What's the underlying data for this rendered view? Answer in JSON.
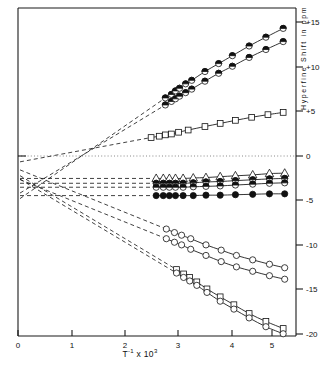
{
  "chart_data": {
    "type": "line",
    "title": "",
    "subtitle": "",
    "xlabel": "T⁻¹ x 10³",
    "ylabel": "Hyperfine  Shift  in  ppm",
    "xlabel_base": "T",
    "xlabel_sup": "-1",
    "xlabel_mid": "x 10",
    "xlabel_sup2": "3",
    "xlim": [
      0,
      5.7
    ],
    "ylim": [
      -21.5,
      16.5
    ],
    "xticks": [
      0,
      1,
      2,
      3,
      4,
      5
    ],
    "xticklabels": [
      "0",
      "1",
      "2",
      "3",
      "4",
      "5"
    ],
    "yticks": [
      15,
      10,
      5,
      0,
      -5,
      -10,
      -15,
      -20
    ],
    "yticklabels": [
      "+15",
      "+10",
      "+5",
      "0",
      "-5",
      "-10",
      "-15",
      "-20"
    ],
    "grid": false,
    "legend": "none",
    "zero_line": true,
    "axis_position": "y-axis ticks on right side, x-axis on bottom",
    "series": [
      {
        "name": "upper-series-1",
        "marker": "half-filled-circle",
        "extrapolated": true,
        "x": [
          2.9,
          3.02,
          3.1,
          3.18,
          3.3,
          3.42,
          3.68,
          3.95,
          4.22,
          4.55,
          4.88,
          5.22
        ],
        "y": [
          6.6,
          7.0,
          7.4,
          7.7,
          8.2,
          8.6,
          9.6,
          10.5,
          11.4,
          12.5,
          13.5,
          14.5
        ]
      },
      {
        "name": "upper-series-2",
        "marker": "half-filled-circle",
        "extrapolated": true,
        "x": [
          2.9,
          3.02,
          3.1,
          3.18,
          3.3,
          3.42,
          3.68,
          3.95,
          4.22,
          4.55,
          4.88,
          5.22
        ],
        "y": [
          5.8,
          6.2,
          6.5,
          6.8,
          7.2,
          7.6,
          8.5,
          9.4,
          10.2,
          11.2,
          12.1,
          13.0
        ]
      },
      {
        "name": "square-series-positive",
        "marker": "open-square",
        "extrapolated": true,
        "x": [
          2.62,
          2.78,
          2.9,
          3.02,
          3.16,
          3.35,
          3.68,
          3.98,
          4.28,
          4.6,
          4.92,
          5.22
        ],
        "y": [
          2.1,
          2.25,
          2.4,
          2.5,
          2.7,
          2.95,
          3.35,
          3.7,
          4.05,
          4.4,
          4.7,
          4.95
        ]
      },
      {
        "name": "cluster-series-triangle",
        "marker": "open-triangle",
        "extrapolated": true,
        "x": [
          2.72,
          2.86,
          2.98,
          3.1,
          3.25,
          3.45,
          3.7,
          3.98,
          4.28,
          4.62,
          4.95,
          5.25
        ],
        "y": [
          -2.55,
          -2.55,
          -2.55,
          -2.55,
          -2.55,
          -2.5,
          -2.45,
          -2.35,
          -2.25,
          -2.15,
          -2.0,
          -1.95
        ]
      },
      {
        "name": "cluster-series-half-a",
        "marker": "half-filled-circle",
        "extrapolated": true,
        "x": [
          2.72,
          2.86,
          2.98,
          3.1,
          3.25,
          3.45,
          3.7,
          3.98,
          4.28,
          4.62,
          4.95,
          5.25
        ],
        "y": [
          -3.1,
          -3.1,
          -3.1,
          -3.1,
          -3.1,
          -3.05,
          -2.95,
          -2.9,
          -2.8,
          -2.7,
          -2.6,
          -2.55
        ]
      },
      {
        "name": "cluster-series-half-b",
        "marker": "half-filled-circle",
        "extrapolated": true,
        "x": [
          2.72,
          2.86,
          2.98,
          3.1,
          3.25,
          3.45,
          3.7,
          3.98,
          4.28,
          4.62,
          4.95,
          5.25
        ],
        "y": [
          -3.55,
          -3.55,
          -3.55,
          -3.55,
          -3.55,
          -3.5,
          -3.45,
          -3.4,
          -3.3,
          -3.2,
          -3.1,
          -3.05
        ]
      },
      {
        "name": "cluster-series-filled",
        "marker": "filled-circle",
        "extrapolated": true,
        "x": [
          2.72,
          2.86,
          2.98,
          3.1,
          3.25,
          3.45,
          3.7,
          3.98,
          4.28,
          4.62,
          4.95,
          5.25
        ],
        "y": [
          -4.5,
          -4.5,
          -4.5,
          -4.5,
          -4.5,
          -4.5,
          -4.45,
          -4.45,
          -4.4,
          -4.35,
          -4.3,
          -4.3
        ]
      },
      {
        "name": "lower-circle-series-1",
        "marker": "open-circle",
        "extrapolated": true,
        "x": [
          2.92,
          3.08,
          3.22,
          3.4,
          3.7,
          4.0,
          4.3,
          4.62,
          4.95,
          5.25
        ],
        "y": [
          -8.3,
          -8.7,
          -9.0,
          -9.4,
          -10.1,
          -10.7,
          -11.3,
          -11.8,
          -12.3,
          -12.7
        ]
      },
      {
        "name": "lower-circle-series-2",
        "marker": "open-circle",
        "extrapolated": true,
        "x": [
          2.92,
          3.08,
          3.22,
          3.4,
          3.7,
          4.0,
          4.3,
          4.62,
          4.95,
          5.25
        ],
        "y": [
          -9.4,
          -9.8,
          -10.1,
          -10.6,
          -11.3,
          -12.0,
          -12.6,
          -13.1,
          -13.6,
          -14.0
        ]
      },
      {
        "name": "lower-square-series",
        "marker": "open-square",
        "extrapolated": true,
        "x": [
          3.12,
          3.26,
          3.38,
          3.52,
          3.72,
          3.98,
          4.25,
          4.55,
          4.88,
          5.22
        ],
        "y": [
          -12.9,
          -13.4,
          -13.8,
          -14.3,
          -15.1,
          -16.0,
          -16.9,
          -17.9,
          -18.8,
          -19.6
        ]
      },
      {
        "name": "lower-bottom-series",
        "marker": "open-circle",
        "extrapolated": true,
        "x": [
          3.12,
          3.26,
          3.38,
          3.52,
          3.72,
          3.98,
          4.25,
          4.55,
          4.88,
          5.22
        ],
        "y": [
          -13.3,
          -13.8,
          -14.2,
          -14.7,
          -15.5,
          -16.5,
          -17.4,
          -18.4,
          -19.4,
          -20.2
        ]
      }
    ],
    "extrapolation_origin": {
      "x": 0.0,
      "y_range": [
        -3.2,
        1.6
      ],
      "note": "dashed lines extrapolate back toward the y-axis intercept region"
    }
  }
}
